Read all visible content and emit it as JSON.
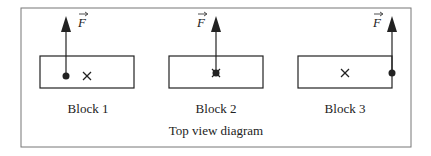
{
  "diagram": {
    "caption": "Top view diagram",
    "force_symbol": "F",
    "colors": {
      "stroke": "#222222",
      "frame": "#777777",
      "background": "#ffffff"
    },
    "blocks": [
      {
        "label": "Block 1",
        "force_application": "left end (off center)",
        "center_mark": "x"
      },
      {
        "label": "Block 2",
        "force_application": "at center",
        "center_mark": "x"
      },
      {
        "label": "Block 3",
        "force_application": "right edge",
        "center_mark": "x"
      }
    ]
  }
}
